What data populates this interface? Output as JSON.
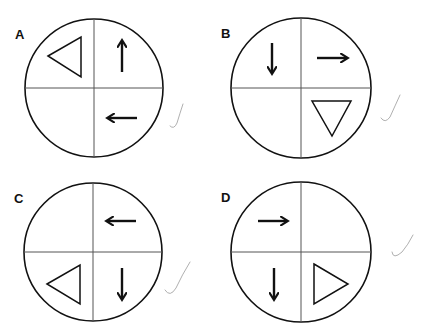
{
  "options": [
    {
      "label": "A",
      "cx": 94,
      "cy": 88,
      "r": 69,
      "items": [
        {
          "quadrant": "top-left",
          "shape": "triangle",
          "direction": "left",
          "points": "48,56 81,37 81,77"
        },
        {
          "quadrant": "top-right",
          "shape": "arrow",
          "direction": "up",
          "x1": 122,
          "y1": 72,
          "x2": 122,
          "y2": 42
        },
        {
          "quadrant": "bottom-right",
          "shape": "arrow",
          "direction": "left",
          "x1": 137,
          "y1": 118,
          "x2": 109,
          "y2": 118
        }
      ],
      "check": {
        "path": "M170,126 Q174,130 177,123 Q180,113 183,104"
      }
    },
    {
      "label": "B",
      "cx": 301,
      "cy": 88,
      "r": 70,
      "items": [
        {
          "quadrant": "top-left",
          "shape": "arrow",
          "direction": "down",
          "x1": 272,
          "y1": 43,
          "x2": 272,
          "y2": 72
        },
        {
          "quadrant": "top-right",
          "shape": "arrow",
          "direction": "right",
          "x1": 317,
          "y1": 58,
          "x2": 346,
          "y2": 58
        },
        {
          "quadrant": "bottom-right",
          "shape": "triangle",
          "direction": "down",
          "points": "312,101 351,101 332,136"
        }
      ],
      "check": {
        "path": "M381,118 Q385,124 390,117 Q395,106 400,95"
      }
    },
    {
      "label": "C",
      "cx": 93,
      "cy": 252,
      "r": 69,
      "items": [
        {
          "quadrant": "top-right",
          "shape": "arrow",
          "direction": "left",
          "x1": 136,
          "y1": 221,
          "x2": 108,
          "y2": 221
        },
        {
          "quadrant": "bottom-left",
          "shape": "triangle",
          "direction": "left",
          "points": "47,284 80,265 80,304"
        },
        {
          "quadrant": "bottom-right",
          "shape": "arrow",
          "direction": "down",
          "x1": 122,
          "y1": 268,
          "x2": 122,
          "y2": 298
        }
      ],
      "check": {
        "path": "M165,290 Q170,298 176,288 Q182,275 190,262"
      }
    },
    {
      "label": "D",
      "cx": 301,
      "cy": 252,
      "r": 70,
      "items": [
        {
          "quadrant": "top-left",
          "shape": "arrow",
          "direction": "right",
          "x1": 258,
          "y1": 221,
          "x2": 286,
          "y2": 221
        },
        {
          "quadrant": "bottom-left",
          "shape": "arrow",
          "direction": "down",
          "x1": 274,
          "y1": 268,
          "x2": 274,
          "y2": 298
        },
        {
          "quadrant": "bottom-right",
          "shape": "triangle",
          "direction": "right",
          "points": "314,264 348,284 314,304"
        }
      ],
      "check": {
        "path": "M392,252 Q393,260 402,252 Q408,245 413,235"
      }
    }
  ],
  "colors": {
    "stroke": "#111111",
    "check": "#b0b0b0",
    "divider": "#555555"
  }
}
